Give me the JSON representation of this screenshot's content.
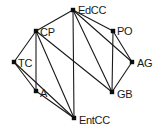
{
  "diagram": {
    "type": "undirected-graph",
    "title": "",
    "width": 155,
    "height": 131,
    "background_color": "#ffffff",
    "node_color": "#0d0d0d",
    "edge_color": "#1a1a1a",
    "label_color": "#1a1a1a",
    "nodes": [
      {
        "id": "EdCC",
        "label": "EdCC",
        "x": 73,
        "y": 10,
        "label_dx": 5,
        "label_dy": 1
      },
      {
        "id": "PO",
        "label": "PO",
        "x": 113,
        "y": 31,
        "label_dx": 4,
        "label_dy": 1
      },
      {
        "id": "CP",
        "label": "CP",
        "x": 36,
        "y": 31,
        "label_dx": 4,
        "label_dy": 2
      },
      {
        "id": "AG",
        "label": "AG",
        "x": 132,
        "y": 62,
        "label_dx": 5,
        "label_dy": 2
      },
      {
        "id": "TC",
        "label": "TC",
        "x": 14,
        "y": 62,
        "label_dx": 4,
        "label_dy": 2
      },
      {
        "id": "GB",
        "label": "GB",
        "x": 112,
        "y": 92,
        "label_dx": 5,
        "label_dy": 3
      },
      {
        "id": "A",
        "label": "A",
        "x": 36,
        "y": 91,
        "label_dx": 4,
        "label_dy": 3
      },
      {
        "id": "EntCC",
        "label": "EntCC",
        "x": 74,
        "y": 118,
        "label_dx": 5,
        "label_dy": 3
      }
    ],
    "edges": [
      {
        "source": "CP",
        "target": "EdCC"
      },
      {
        "source": "EdCC",
        "target": "PO"
      },
      {
        "source": "EdCC",
        "target": "AG"
      },
      {
        "source": "EdCC",
        "target": "GB"
      },
      {
        "source": "EdCC",
        "target": "EntCC"
      },
      {
        "source": "PO",
        "target": "AG"
      },
      {
        "source": "PO",
        "target": "GB"
      },
      {
        "source": "AG",
        "target": "GB"
      },
      {
        "source": "CP",
        "target": "TC"
      },
      {
        "source": "CP",
        "target": "A"
      },
      {
        "source": "CP",
        "target": "GB"
      },
      {
        "source": "CP",
        "target": "EntCC"
      },
      {
        "source": "TC",
        "target": "A"
      },
      {
        "source": "TC",
        "target": "EntCC"
      },
      {
        "source": "A",
        "target": "EntCC"
      }
    ]
  }
}
